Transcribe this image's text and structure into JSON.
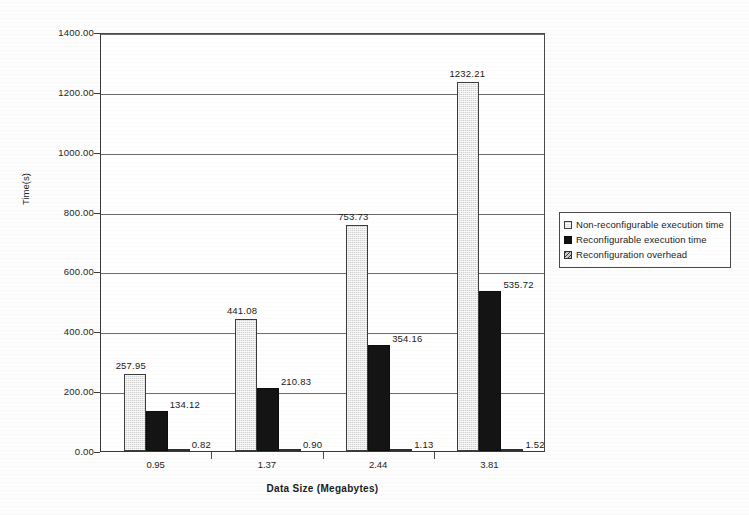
{
  "chart_data": {
    "type": "bar",
    "title": "",
    "xlabel": "Data Size (Megabytes)",
    "ylabel": "Time(s)",
    "categories": [
      "0.95",
      "1.37",
      "2.44",
      "3.81"
    ],
    "ylim": [
      0,
      1400
    ],
    "ytick_labels": [
      "1400.00",
      "1200.00",
      "1000.00",
      "800.00",
      "600.00",
      "400.00",
      "200.00",
      "0.00"
    ],
    "ytick_values": [
      1400,
      1200,
      1000,
      800,
      600,
      400,
      200,
      0
    ],
    "grid": "horizontal",
    "legend_position": "right",
    "series": [
      {
        "name": "Non-reconfigurable execution time",
        "values": [
          257.95,
          441.08,
          753.73,
          1232.21
        ],
        "labels": [
          "257.95",
          "441.08",
          "753.73",
          "1232.21"
        ],
        "swatch": "light-dotted"
      },
      {
        "name": "Reconfigurable execution time",
        "values": [
          134.12,
          210.83,
          354.16,
          535.72
        ],
        "labels": [
          "134.12",
          "210.83",
          "354.16",
          "535.72"
        ],
        "swatch": "solid-black"
      },
      {
        "name": "Reconfiguration overhead",
        "values": [
          0.82,
          0.9,
          1.13,
          1.52
        ],
        "labels": [
          "0.82",
          "0.90",
          "1.13",
          "1.52"
        ],
        "swatch": "hatched"
      }
    ]
  }
}
